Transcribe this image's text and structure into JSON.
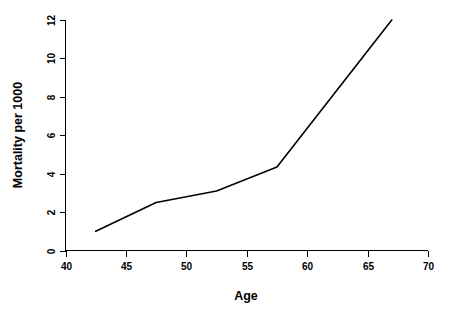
{
  "chart_data": {
    "type": "line",
    "title": "",
    "xlabel": "Age",
    "ylabel": "Mortality per 1000",
    "xlim": [
      40,
      70
    ],
    "ylim": [
      0,
      12
    ],
    "xticks": [
      40,
      45,
      50,
      55,
      60,
      65,
      70
    ],
    "yticks": [
      0,
      2,
      4,
      6,
      8,
      10,
      12
    ],
    "xtick_labels": [
      "40",
      "45",
      "50",
      "55",
      "60",
      "65",
      "70"
    ],
    "ytick_labels": [
      "0",
      "2",
      "4",
      "6",
      "8",
      "10",
      "12"
    ],
    "grid": false,
    "legend": false,
    "legend_position": "none",
    "line_color": "#000000",
    "background_color": "#ffffff",
    "markers": false,
    "x": [
      42.5,
      47.5,
      52.5,
      57.5,
      67.0
    ],
    "values": [
      1.0,
      2.5,
      3.1,
      4.35,
      12.0
    ],
    "series": [
      {
        "name": "Mortality per 1000",
        "x": [
          42.5,
          47.5,
          52.5,
          57.5,
          67.0
        ],
        "values": [
          1.0,
          2.5,
          3.1,
          4.35,
          12.0
        ]
      }
    ],
    "annotations": []
  },
  "axes": {
    "x_title": "Age",
    "y_title": "Mortality per 1000"
  }
}
